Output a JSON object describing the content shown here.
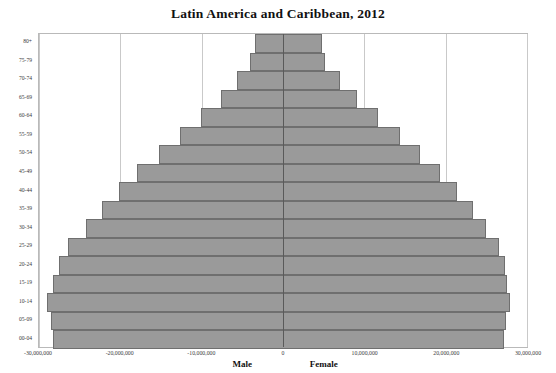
{
  "chart_data": {
    "type": "bar",
    "subtype": "population-pyramid",
    "title": "Latin America and Caribbean, 2012",
    "xlabel": "",
    "ylabel": "",
    "categories": [
      "00-04",
      "05-09",
      "10-14",
      "15-19",
      "20-24",
      "25-29",
      "30-34",
      "35-39",
      "40-44",
      "45-49",
      "50-54",
      "55-59",
      "60-64",
      "65-69",
      "70-74",
      "75-79",
      "80+"
    ],
    "series": [
      {
        "name": "Male",
        "side": "left",
        "sign": "negative",
        "values": [
          -28300000,
          -28500000,
          -29000000,
          -28300000,
          -27600000,
          -26400000,
          -24200000,
          -22300000,
          -20200000,
          -17900000,
          -15300000,
          -12700000,
          -10100000,
          -7600000,
          -5700000,
          -4000000,
          -3500000
        ]
      },
      {
        "name": "Female",
        "side": "right",
        "sign": "positive",
        "values": [
          27200000,
          27400000,
          27900000,
          27500000,
          27300000,
          26600000,
          24900000,
          23300000,
          21400000,
          19300000,
          16900000,
          14400000,
          11700000,
          9100000,
          7000000,
          5200000,
          4800000
        ]
      }
    ],
    "xlim": [
      -30000000,
      30000000
    ],
    "xticks": [
      -30000000,
      -20000000,
      -10000000,
      0,
      10000000,
      20000000,
      30000000
    ],
    "xtick_labels": [
      "-30,000,000",
      "-20,000,000",
      "-10,000,000",
      "0",
      "10,000,000",
      "20,000,000",
      "30,000,000"
    ],
    "grid": true,
    "grid_axis": "x",
    "legend": false,
    "axis_labels_below": [
      "Male",
      "Female"
    ],
    "colors": {
      "bar_fill": "#9a9a9a",
      "bar_border": "#6f6f6f",
      "gridline": "#c9c9c9",
      "zero_axis": "#5a5a5a",
      "plot_border": "#b9b9b9",
      "text": "#3a3a3a",
      "title": "#111111",
      "background": "#ffffff"
    }
  }
}
